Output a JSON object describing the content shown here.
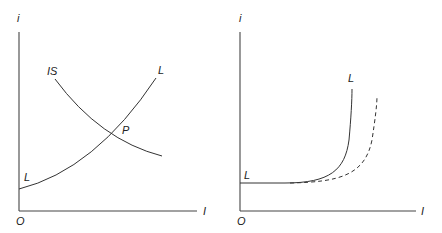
{
  "panels": [
    {
      "id": "left",
      "y_axis_label": "i",
      "x_axis_label": "I",
      "origin_label": "O",
      "curves": [
        {
          "name": "IS",
          "label": "IS",
          "style": "solid",
          "shape": "downward-sloping"
        },
        {
          "name": "LL",
          "label_top": "L",
          "label_bottom": "L",
          "style": "solid",
          "shape": "upward-sloping convex"
        }
      ],
      "intersection_label": "P"
    },
    {
      "id": "right",
      "y_axis_label": "i",
      "x_axis_label": "I",
      "origin_label": "O",
      "curves": [
        {
          "name": "LL",
          "label_top": "L",
          "label_bottom": "L",
          "style": "solid",
          "shape": "flat then steeply rising (liquidity trap)"
        },
        {
          "name": "LL-shifted",
          "style": "dashed",
          "shape": "flat then rising, shifted right"
        }
      ]
    }
  ]
}
